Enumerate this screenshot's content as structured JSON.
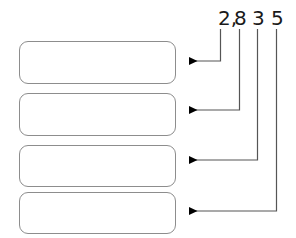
{
  "figure": {
    "type": "place-value-callout-diagram",
    "number": "2,835",
    "background_color": "#ffffff",
    "box_border_color": "#8d8d8d",
    "box_fill_color": "#ffffff",
    "leader_line_color": "#555555",
    "digit_text_color": "#1a1a1a"
  },
  "digits": [
    {
      "label": "2,",
      "x": 218,
      "text_y": 8,
      "line_x": 220.5,
      "arrow_y": 61,
      "arrow_tip_x": 188
    },
    {
      "label": "8",
      "x": 234,
      "text_y": 8,
      "line_x": 239.5,
      "arrow_y": 110,
      "arrow_tip_x": 188
    },
    {
      "label": "3",
      "x": 252,
      "text_y": 8,
      "line_x": 257.5,
      "arrow_y": 160,
      "arrow_tip_x": 188
    },
    {
      "label": "5",
      "x": 271,
      "text_y": 8,
      "line_x": 276.5,
      "arrow_y": 211,
      "arrow_tip_x": 188
    }
  ],
  "boxes": [
    {
      "name": "answer-box-1",
      "value": "",
      "x": 19,
      "y": 41,
      "width": 157,
      "height": 43
    },
    {
      "name": "answer-box-2",
      "value": "",
      "x": 19,
      "y": 93,
      "width": 157,
      "height": 43
    },
    {
      "name": "answer-box-3",
      "value": "",
      "x": 19,
      "y": 145,
      "width": 157,
      "height": 42
    },
    {
      "name": "answer-box-4",
      "value": "",
      "x": 19,
      "y": 192,
      "width": 157,
      "height": 42
    }
  ]
}
